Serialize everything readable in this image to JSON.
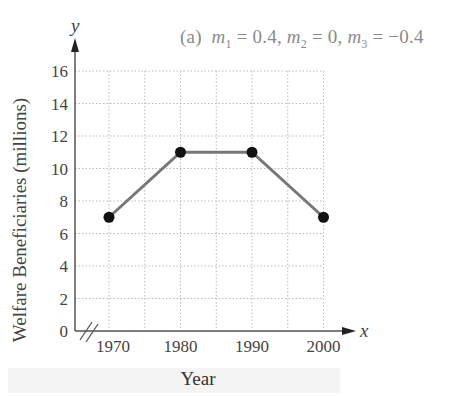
{
  "caption": {
    "label": "(a)",
    "m1_name": "m",
    "m1_sub": "1",
    "m1_value": "0.4",
    "m2_name": "m",
    "m2_sub": "2",
    "m2_value": "0",
    "m3_name": "m",
    "m3_sub": "3",
    "m3_value": "−0.4"
  },
  "axes": {
    "y_symbol": "y",
    "x_symbol": "x",
    "ylabel": "Welfare Beneficiaries (millions)",
    "xlabel": "Year"
  },
  "colors": {
    "line": "#777777",
    "point": "#111111",
    "axis": "#555555",
    "grid": "#bbbbbb",
    "tick_text": "#444444"
  },
  "chart_data": {
    "type": "line",
    "xlabel": "Year",
    "ylabel": "Welfare Beneficiaries (millions)",
    "x": [
      1970,
      1980,
      1990,
      2000
    ],
    "series": [
      {
        "name": "Welfare Beneficiaries",
        "values": [
          7,
          11,
          11,
          7
        ]
      }
    ],
    "x_ticks": [
      "1970",
      "1980",
      "1990",
      "2000"
    ],
    "y_ticks": [
      "0",
      "2",
      "4",
      "6",
      "8",
      "10",
      "12",
      "14",
      "16"
    ],
    "xlim": [
      1965,
      2002
    ],
    "ylim": [
      0,
      16
    ],
    "x_axis_break": true,
    "grid": true,
    "grid_minor_x_step": 5,
    "grid_y_step": 2,
    "legend": "none"
  }
}
